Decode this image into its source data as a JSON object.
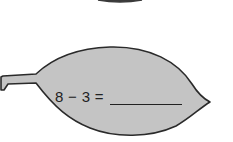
{
  "worksheet": {
    "problem": {
      "equation_text": "8 − 3 =",
      "answer": ""
    }
  },
  "colors": {
    "leaf_fill": "#c4c4c4",
    "leaf_stroke": "#2a2a2a",
    "text": "#222222",
    "background": "#ffffff"
  }
}
